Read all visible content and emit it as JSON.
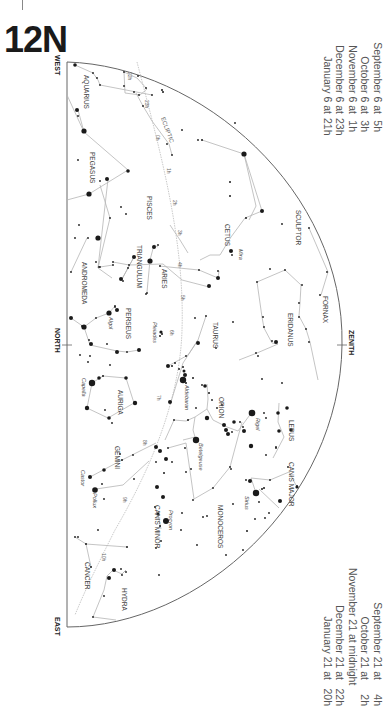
{
  "page": {
    "title": "12N"
  },
  "times_top": [
    {
      "label": "September 6 at",
      "hour": "5h"
    },
    {
      "label": "October 6 at",
      "hour": "3h"
    },
    {
      "label": "November 6 at",
      "hour": "1h"
    },
    {
      "label": "December 6 at",
      "hour": "23h"
    },
    {
      "label": "January 6 at",
      "hour": "21h"
    }
  ],
  "times_bottom": [
    {
      "label": "September 21 at",
      "hour": "4h"
    },
    {
      "label": "October 21 at",
      "hour": "2h"
    },
    {
      "label": "November 21 at midnight",
      "hour": ""
    },
    {
      "label": "December 21 at",
      "hour": "22h"
    },
    {
      "label": "January 21 at",
      "hour": "20h"
    }
  ],
  "directions": {
    "west": "WEST",
    "north": "NORTH",
    "east": "EAST",
    "zenith": "ZENITH"
  },
  "ecliptic": {
    "label": "ECLIPTIC",
    "marks": [
      "22h",
      "23h",
      "0h",
      "1h",
      "2h",
      "3h",
      "4h",
      "5h",
      "6h",
      "7h",
      "8h",
      "9h",
      "10h"
    ]
  },
  "constellations": [
    "AQUARIUS",
    "PEGASUS",
    "PISCES",
    "CETUS",
    "SCULPTOR",
    "FORNAX",
    "ANDROMEDA",
    "TRIANGULUM",
    "ARIES",
    "PERSEUS",
    "TAURUS",
    "ERIDANUS",
    "AURIGA",
    "ORION",
    "LEPUS",
    "GEMINI",
    "CANIS MAJOR",
    "CANIS MINOR",
    "MONOCEROS",
    "CANCER",
    "HYDRA"
  ],
  "named_stars": [
    "Mira",
    "Algol",
    "Pleiades",
    "Aldebaran",
    "Capella",
    "Rigel",
    "Betelgeuse",
    "Sirius",
    "Castor",
    "Pollux",
    "Procyon"
  ],
  "colors": {
    "outline": "#555555",
    "lines": "#b0b0b0",
    "stars": "#1a1a1a",
    "text": "#444444"
  }
}
